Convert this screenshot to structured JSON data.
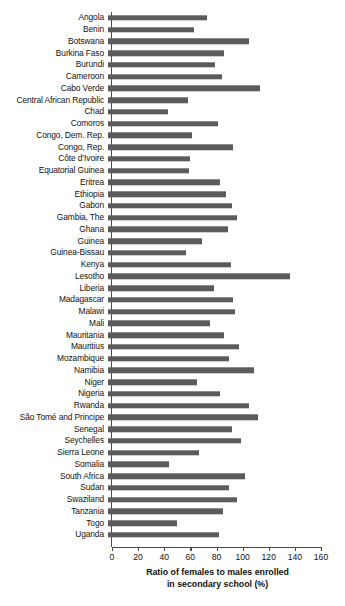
{
  "chart_data": {
    "type": "bar",
    "orientation": "horizontal",
    "title": "",
    "xlabel": "Ratio of females to males enrolled in secondary school (%)",
    "xlabel_line1": "Ratio of females to males enrolled",
    "xlabel_line2": "in secondary school (%)",
    "ylabel": "",
    "xlim": [
      0,
      160
    ],
    "xticks": [
      0,
      20,
      40,
      60,
      80,
      100,
      120,
      140,
      160
    ],
    "grid": false,
    "legend": false,
    "bar_color": "#5b5b5b",
    "categories": [
      "Angola",
      "Benin",
      "Botswana",
      "Burkina Faso",
      "Burundi",
      "Cameroon",
      "Cabo Verde",
      "Central African Republic",
      "Chad",
      "Comoros",
      "Congo, Dem. Rep.",
      "Congo, Rep.",
      "Côte d’Ivoire",
      "Equatorial Guinea",
      "Eritrea",
      "Ethiopia",
      "Gabon",
      "Gambia, The",
      "Ghana",
      "Guinea",
      "Guinea-Bissau",
      "Kenya",
      "Lesotho",
      "Liberia",
      "Madagascar",
      "Malawi",
      "Mali",
      "Mauritania",
      "Mauritius",
      "Mozambique",
      "Namibia",
      "Niger",
      "Nigeria",
      "Rwanda",
      "São Tomé and Principe",
      "Senegal",
      "Seychelles",
      "Sierra Leone",
      "Somalia",
      "South Africa",
      "Sudan",
      "Swaziland",
      "Tanzania",
      "Togo",
      "Uganda"
    ],
    "values": [
      76,
      66,
      108,
      89,
      82,
      87,
      116,
      61,
      46,
      84,
      64,
      96,
      63,
      62,
      86,
      90,
      95,
      99,
      92,
      72,
      60,
      94,
      139,
      81,
      96,
      97,
      78,
      89,
      100,
      93,
      112,
      68,
      86,
      108,
      115,
      95,
      102,
      70,
      47,
      105,
      93,
      99,
      88,
      53,
      85
    ]
  }
}
